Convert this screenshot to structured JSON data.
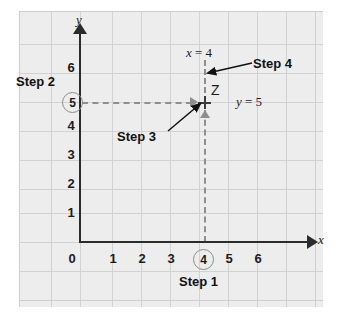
{
  "figure": {
    "background_color": "#ededed",
    "grid_color": "#d2d2d2",
    "axis_color": "#2b2b2b",
    "dash_color": "#8e8e8e"
  },
  "axes": {
    "x_name": "x",
    "y_name": "y",
    "x_ticks": [
      "0",
      "1",
      "2",
      "3",
      "4",
      "5",
      "6"
    ],
    "y_ticks": [
      "1",
      "2",
      "3",
      "4",
      "5",
      "6"
    ],
    "x_range": [
      0,
      7
    ],
    "y_range": [
      0,
      7
    ]
  },
  "point": {
    "label": "Z",
    "x_value": "4",
    "y_value": "5",
    "x_equation": "x = 4",
    "y_equation": "y = 5"
  },
  "callouts": {
    "step1": "Step 1",
    "step2": "Step 2",
    "step3": "Step 3",
    "step4": "Step 4"
  },
  "circled": {
    "x": "4",
    "y": "5"
  },
  "ticks": {
    "x0": "0",
    "x1": "1",
    "x2": "2",
    "x3": "3",
    "x5": "5",
    "x6": "6",
    "y1": "1",
    "y2": "2",
    "y3": "3",
    "y4": "4",
    "y6": "6"
  }
}
